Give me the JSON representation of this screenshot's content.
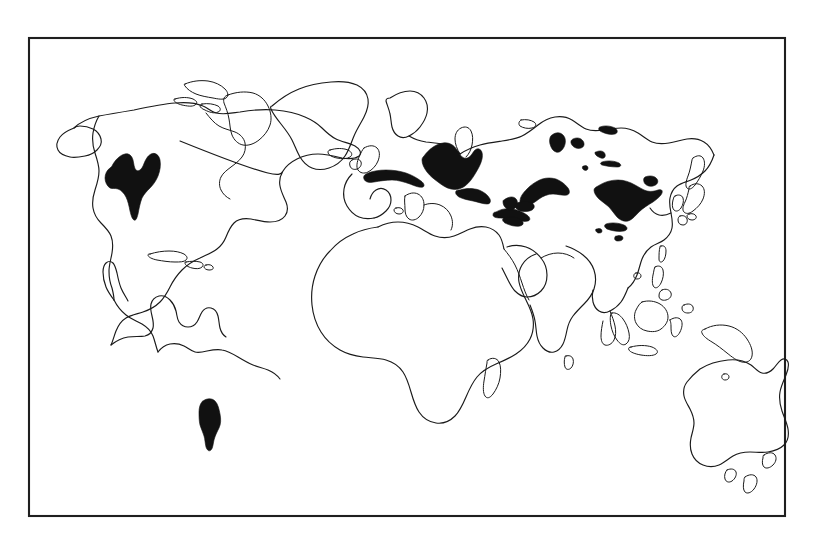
{
  "figure": {
    "kind": "world-distribution-map",
    "title": "",
    "caption": "",
    "projection": "equirectangular",
    "frame": {
      "x": 29,
      "y": 38,
      "width": 756,
      "height": 478,
      "stroke_color": "#1f1f1f",
      "fill_color": "#ffffff"
    },
    "style": {
      "background_color": "#ffffff",
      "coastline_color": "#1a1a1a",
      "shaded_region_color": "#111111",
      "line_art": true,
      "has_gridlines": false,
      "has_labels": false,
      "has_legend": false,
      "has_axis_ticks": false
    }
  },
  "legend": {
    "visible": false,
    "entries": []
  },
  "landmasses": [
    {
      "name": "north-america",
      "label": ""
    },
    {
      "name": "greenland",
      "label": ""
    },
    {
      "name": "canadian-arctic-islands",
      "label": ""
    },
    {
      "name": "central-america",
      "label": ""
    },
    {
      "name": "caribbean-islands",
      "label": ""
    },
    {
      "name": "south-america",
      "label": ""
    },
    {
      "name": "africa",
      "label": ""
    },
    {
      "name": "europe",
      "label": ""
    },
    {
      "name": "british-isles",
      "label": ""
    },
    {
      "name": "iceland",
      "label": ""
    },
    {
      "name": "scandinavia",
      "label": ""
    },
    {
      "name": "asia",
      "label": ""
    },
    {
      "name": "arabian-peninsula",
      "label": ""
    },
    {
      "name": "india",
      "label": ""
    },
    {
      "name": "sri-lanka",
      "label": ""
    },
    {
      "name": "japan",
      "label": ""
    },
    {
      "name": "korean-peninsula",
      "label": ""
    },
    {
      "name": "taiwan",
      "label": ""
    },
    {
      "name": "philippines",
      "label": ""
    },
    {
      "name": "borneo",
      "label": ""
    },
    {
      "name": "sumatra",
      "label": ""
    },
    {
      "name": "java",
      "label": ""
    },
    {
      "name": "sulawesi",
      "label": ""
    },
    {
      "name": "new-guinea",
      "label": ""
    },
    {
      "name": "australia",
      "label": ""
    },
    {
      "name": "tasmania",
      "label": ""
    },
    {
      "name": "new-zealand",
      "label": ""
    },
    {
      "name": "madagascar",
      "label": ""
    }
  ],
  "shaded_regions": [
    {
      "name": "shaded-region-north-america",
      "region": "central-north-america",
      "approx_center": [
        134,
        182
      ]
    },
    {
      "name": "shaded-region-south-america",
      "region": "southern-south-america",
      "approx_center": [
        210,
        424
      ]
    },
    {
      "name": "shaded-region-mediterranean-band",
      "region": "southern-europe",
      "approx_center": [
        398,
        173
      ]
    },
    {
      "name": "shaded-region-eastern-europe",
      "region": "eastern-europe",
      "approx_center": [
        447,
        163
      ]
    },
    {
      "name": "shaded-region-caucasus",
      "region": "caucasus-anatolia",
      "approx_center": [
        474,
        195
      ]
    },
    {
      "name": "shaded-region-central-asia-west",
      "region": "central-asia-west",
      "approx_center": [
        512,
        205
      ]
    },
    {
      "name": "shaded-region-central-asia-north",
      "region": "central-asia-north",
      "approx_center": [
        559,
        142
      ]
    },
    {
      "name": "shaded-region-central-asia-mid",
      "region": "central-asia-mid",
      "approx_center": [
        580,
        142
      ]
    },
    {
      "name": "shaded-region-mongolia-strip",
      "region": "mongolia-strip",
      "approx_center": [
        609,
        130
      ]
    },
    {
      "name": "shaded-region-inner-asia-streaks",
      "region": "inner-asia-streaks",
      "approx_center": [
        604,
        157
      ]
    },
    {
      "name": "shaded-region-tibet-plateau",
      "region": "tibetan-plateau",
      "approx_center": [
        549,
        188
      ]
    },
    {
      "name": "shaded-region-himalaya",
      "region": "himalaya-foothills",
      "approx_center": [
        530,
        207
      ]
    },
    {
      "name": "shaded-region-eastern-china",
      "region": "eastern-china",
      "approx_center": [
        626,
        197
      ]
    },
    {
      "name": "shaded-region-northeast-china",
      "region": "northeast-china",
      "approx_center": [
        648,
        180
      ]
    },
    {
      "name": "shaded-region-southern-china",
      "region": "southern-china",
      "approx_center": [
        620,
        223
      ]
    },
    {
      "name": "shaded-region-indochina-spot",
      "region": "indochina",
      "approx_center": [
        621,
        237
      ]
    }
  ],
  "chart_data": {
    "type": "map",
    "title": "",
    "xlabel": "",
    "ylabel": "",
    "shaded_area_count": 16,
    "shaded_by_continent": {
      "north-america": 1,
      "south-america": 1,
      "europe": 3,
      "asia": 11,
      "africa": 0,
      "australia": 0
    }
  }
}
